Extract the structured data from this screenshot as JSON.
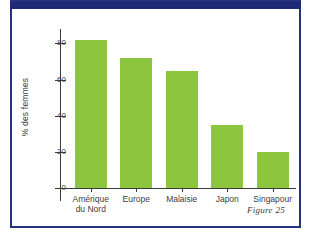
{
  "figure": {
    "caption": "Figure 25",
    "banner_color": "#1e2a75",
    "border_color": "#27327d",
    "bar_color": "#8cc63f"
  },
  "chart_data": {
    "type": "bar",
    "title": "",
    "xlabel": "",
    "ylabel": "% des femmes",
    "categories": [
      "Amérique\ndu Nord",
      "Europe",
      "Malaisie",
      "Japon",
      "Singapour"
    ],
    "category_labels_flat": [
      "Amérique du Nord",
      "Europe",
      "Malaisie",
      "Japon",
      "Singapour"
    ],
    "values": [
      82,
      72,
      65,
      35,
      20
    ],
    "ylim": [
      0,
      88
    ],
    "yticks": [
      0,
      20,
      40,
      60,
      80
    ],
    "ytick_labels": [
      "0",
      "20",
      "40",
      "60",
      "80"
    ],
    "grid": false,
    "legend": false,
    "series_color": "#8cc63f"
  }
}
